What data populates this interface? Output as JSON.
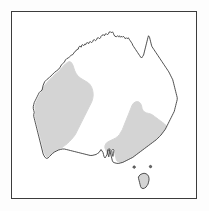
{
  "figure": {
    "kind": "distribution-map",
    "frame": {
      "border_color": "#3c3c3c",
      "border_width_px": 1.4,
      "background_color": "#ffffff",
      "outer_background_color": "#fdfdfd",
      "x": 11,
      "y": 11,
      "width": 186,
      "height": 188
    },
    "styles": {
      "coastline_color": "#3a3a3a",
      "coastline_width_px": 0.9,
      "land_fill_color": "#ffffff",
      "range_fill_color": "#d4d4d4",
      "range_edge_color": "#d4d4d4"
    },
    "landmasses": [
      {
        "name": "australia-mainland",
        "label": "Australia mainland"
      },
      {
        "name": "tasmania",
        "label": "Tasmania"
      },
      {
        "name": "bass-strait-islet-west",
        "label": "Bass Strait islet (west)"
      },
      {
        "name": "bass-strait-islet-east",
        "label": "Bass Strait islet (east)"
      }
    ],
    "shaded_regions": [
      {
        "name": "western-range",
        "label": "Western shaded distribution area",
        "fill": "#d4d4d4"
      },
      {
        "name": "eastern-range",
        "label": "Eastern shaded distribution area",
        "fill": "#d4d4d4"
      },
      {
        "name": "tasmania-range",
        "label": "Tasmania shaded distribution area",
        "fill": "#d4d4d4"
      }
    ]
  },
  "geometry": {
    "mainland_outline": "M 30.5,78.5 L 31.5,74.0 L 33.0,70.5 L 35.5,68.0 L 38.0,66.0 L 40.5,63.5 L 43.0,61.0 L 45.0,59.5 L 47.0,58.0 L 48.5,56.0 L 50.0,53.5 L 51.5,52.0 L 53.0,50.5 L 54.0,48.5 L 55.5,47.0 L 57.0,46.5 L 58.5,45.0 L 60.0,43.5 L 61.5,43.0 L 62.5,41.5 L 63.5,40.0 L 64.5,39.5 L 65.5,38.0 L 67.0,37.5 L 67.5,35.5 L 68.5,34.5 L 70.0,35.5 L 70.5,33.5 L 71.5,33.0 L 72.5,34.0 L 73.5,32.5 L 74.5,33.0 L 75.0,31.5 L 76.5,31.0 L 77.5,32.0 L 78.0,30.5 L 79.5,30.0 L 80.5,31.0 L 81.5,30.0 L 82.0,28.5 L 83.5,28.0 L 84.5,29.0 L 85.5,28.0 L 86.0,26.5 L 87.5,26.0 L 88.5,27.0 L 89.5,26.0 L 90.0,24.5 L 91.0,23.5 L 92.5,23.0 L 93.5,24.0 L 94.0,22.5 L 95.5,22.0 L 96.5,23.0 L 97.5,22.0 L 98.0,20.5 L 99.5,20.0 L 100.5,21.0 L 101.5,20.0 L 102.5,21.5 L 103.0,23.0 L 104.0,24.5 L 105.5,25.0 L 106.5,24.0 L 107.5,25.0 L 108.5,24.0 L 109.5,25.5 L 110.5,24.5 L 111.5,25.5 L 112.5,24.5 L 113.5,25.5 L 114.5,27.0 L 115.5,26.0 L 116.5,27.0 L 117.5,26.0 L 118.5,27.5 L 119.5,29.0 L 120.5,30.5 L 121.5,32.0 L 122.0,33.5 L 123.0,35.0 L 124.0,36.5 L 125.0,38.0 L 126.0,39.5 L 127.0,41.0 L 128.0,42.5 L 129.0,44.0 L 130.0,45.5 L 131.0,46.5 L 132.0,45.0 L 133.0,43.5 L 133.5,41.5 L 134.0,39.5 L 134.5,37.5 L 135.0,35.5 L 135.5,33.5 L 136.0,31.5 L 136.5,29.5 L 137.0,27.5 L 137.5,25.5 L 138.0,24.0 L 139.0,25.5 L 139.5,27.5 L 140.0,29.5 L 140.5,31.5 L 141.0,33.5 L 141.5,35.0 L 142.5,36.5 L 143.5,38.0 L 144.5,39.5 L 145.5,41.0 L 146.5,42.5 L 147.5,44.0 L 148.5,45.5 L 149.5,47.0 L 150.5,48.5 L 151.5,50.0 L 152.5,51.5 L 153.5,53.0 L 154.5,54.5 L 155.5,56.0 L 156.5,57.5 L 157.5,59.0 L 158.5,60.5 L 159.5,62.5 L 160.5,64.5 L 161.5,66.5 L 162.5,68.5 L 163.0,70.5 L 163.5,72.5 L 164.0,74.5 L 164.5,76.5 L 165.0,78.5 L 165.5,80.5 L 166.0,82.5 L 166.5,84.5 L 167.0,86.5 L 167.0,88.5 L 166.5,90.5 L 166.0,92.5 L 165.5,94.5 L 165.0,96.5 L 164.5,98.5 L 164.0,100.5 L 163.0,102.5 L 162.0,104.5 L 161.0,106.5 L 160.0,108.5 L 159.0,110.5 L 158.0,112.5 L 157.0,114.5 L 156.0,116.5 L 155.0,118.5 L 153.5,120.5 L 152.0,122.5 L 150.5,124.5 L 149.0,126.0 L 147.5,127.5 L 146.0,129.0 L 144.0,130.5 L 142.0,132.0 L 140.0,133.5 L 138.0,135.0 L 136.0,136.5 L 134.0,138.0 L 132.0,139.5 L 130.0,141.0 L 128.0,142.5 L 126.0,144.0 L 124.0,145.5 L 122.0,147.0 L 120.0,148.0 L 118.0,149.0 L 116.0,150.0 L 114.0,151.0 L 112.0,152.0 L 110.0,152.5 L 108.0,153.0 L 106.0,153.0 L 104.0,152.5 L 102.5,152.0 L 101.5,150.5 L 101.0,148.5 L 100.5,146.5 L 100.0,144.5 L 99.5,142.5 L 99.0,140.5 L 98.0,139.0 L 97.0,140.5 L 96.5,142.5 L 96.0,144.5 L 95.0,146.0 L 94.0,147.5 L 93.0,146.0 L 92.5,144.0 L 92.0,142.0 L 91.0,140.5 L 90.0,139.0 L 89.0,140.5 L 88.0,142.0 L 86.5,143.0 L 85.0,144.0 L 83.0,144.5 L 81.0,145.0 L 79.0,145.0 L 77.0,144.5 L 75.0,144.0 L 73.0,143.5 L 71.0,143.0 L 69.0,142.5 L 67.0,142.0 L 65.0,141.5 L 63.0,141.0 L 61.0,140.5 L 59.0,140.0 L 57.0,139.5 L 55.0,139.0 L 53.0,138.5 L 51.0,138.5 L 49.0,139.0 L 47.0,139.5 L 45.0,140.5 L 43.0,141.5 L 41.0,143.0 L 39.5,144.5 L 38.0,146.0 L 36.5,147.5 L 35.0,148.0 L 33.5,147.0 L 32.5,145.5 L 31.5,143.5 L 31.0,141.5 L 30.5,139.5 L 30.0,137.5 L 29.5,135.5 L 29.0,133.5 L 28.5,131.5 L 28.0,129.5 L 27.5,127.5 L 27.0,125.5 L 26.5,123.5 L 26.0,121.5 L 25.5,119.5 L 25.0,117.5 L 24.5,115.5 L 24.0,113.5 L 23.5,111.5 L 23.0,109.5 L 22.5,107.5 L 22.0,105.5 L 22.0,103.5 L 22.5,101.5 L 22.0,99.5 L 21.5,97.5 L 21.5,95.5 L 22.0,93.5 L 22.5,91.5 L 23.5,89.5 L 24.5,87.5 L 25.5,85.5 L 26.5,83.5 L 27.5,81.5 L 29.0,80.0 Z",
    "western_range": "M 33.5,73.5 L 36.0,70.5 L 38.5,68.0 L 41.0,65.5 L 43.5,63.0 L 46.0,61.0 L 48.0,59.0 L 50.0,56.5 L 52.0,54.5 L 54.0,52.5 L 56.0,51.0 L 58.0,50.0 L 60.0,51.0 L 61.5,53.5 L 62.5,56.5 L 63.5,59.5 L 65.0,62.5 L 67.0,65.0 L 69.5,67.0 L 72.0,68.5 L 74.5,70.0 L 77.0,71.5 L 79.0,73.5 L 80.5,76.0 L 81.5,79.0 L 82.0,82.0 L 82.0,85.0 L 81.5,88.0 L 80.5,91.0 L 79.0,94.0 L 77.5,97.0 L 76.0,100.0 L 74.5,103.0 L 73.0,106.0 L 71.5,109.0 L 70.0,112.0 L 68.5,115.0 L 67.0,118.0 L 65.5,121.0 L 64.0,124.0 L 62.0,126.5 L 60.0,129.0 L 58.0,131.0 L 56.0,133.0 L 54.0,134.5 L 52.0,136.0 L 50.0,137.5 L 48.0,138.5 L 46.0,139.5 L 44.0,140.5 L 42.0,142.0 L 40.0,143.5 L 38.0,145.0 L 36.5,146.0 L 35.2,146.5 L 34.0,145.0 L 33.0,143.0 L 32.3,141.0 L 31.8,139.0 L 31.3,137.0 L 30.8,135.0 L 30.3,133.0 L 29.8,131.0 L 29.3,129.0 L 28.8,127.0 L 28.3,125.0 L 27.8,123.0 L 27.3,121.0 L 26.8,119.0 L 26.3,117.0 L 25.8,115.0 L 25.3,113.0 L 24.8,111.0 L 24.3,109.0 L 23.8,107.0 L 23.5,105.0 L 23.5,103.0 L 24.0,101.0 L 23.5,99.0 L 23.2,97.0 L 23.2,95.0 L 23.8,93.0 L 24.5,91.0 L 25.5,89.0 L 26.5,87.0 L 27.5,85.0 L 28.5,83.0 L 29.5,81.0 L 31.0,78.5 L 32.0,76.0 Z",
    "eastern_range": "M 121.0,95.0 L 122.5,92.5 L 124.5,91.0 L 126.5,90.5 L 128.5,91.0 L 130.0,92.5 L 131.0,95.0 L 131.5,97.5 L 132.5,99.5 L 134.0,101.0 L 136.0,102.0 L 138.0,102.5 L 140.0,103.0 L 142.0,104.0 L 144.0,105.5 L 146.0,107.0 L 148.0,108.5 L 150.0,110.0 L 152.0,111.5 L 154.0,113.0 L 155.5,114.5 L 156.5,116.5 L 157.0,118.5 L 156.5,120.5 L 155.5,122.5 L 154.0,124.5 L 152.5,126.5 L 151.0,128.5 L 149.5,130.5 L 148.0,132.0 L 146.0,133.5 L 144.0,135.0 L 142.0,136.5 L 140.0,138.0 L 138.0,139.5 L 136.0,141.0 L 134.0,142.5 L 132.0,144.0 L 130.0,145.5 L 128.0,147.0 L 126.0,148.0 L 124.0,149.0 L 122.0,150.0 L 120.0,151.0 L 118.0,151.5 L 116.0,152.0 L 114.0,152.3 L 112.0,152.3 L 110.0,152.0 L 108.0,151.5 L 106.5,151.0 L 105.5,149.5 L 105.0,147.5 L 104.5,145.5 L 104.0,143.5 L 103.5,141.5 L 103.0,139.5 L 102.3,138.0 L 101.5,139.5 L 101.0,141.5 L 100.5,143.5 L 99.8,145.5 L 99.0,147.0 L 98.0,148.0 L 97.0,146.5 L 96.5,144.5 L 96.0,142.5 L 95.3,140.5 L 94.5,139.0 L 93.8,137.0 L 94.0,135.0 L 95.0,133.0 L 96.5,131.5 L 98.5,130.5 L 100.5,129.5 L 102.5,128.5 L 104.5,127.5 L 106.5,126.0 L 108.5,124.0 L 110.0,121.5 L 111.5,119.0 L 112.5,116.5 L 113.5,114.0 L 114.5,111.5 L 115.5,109.0 L 116.5,106.5 L 117.5,104.0 L 118.5,101.5 L 119.5,99.0 L 120.3,97.0 Z",
    "tasmania_outline": "M 128.0,166.5 L 129.5,164.5 L 131.5,163.5 L 133.5,163.0 L 135.5,163.5 L 137.0,164.5 L 138.0,166.0 L 138.5,168.0 L 138.5,170.0 L 138.0,172.0 L 137.5,174.0 L 136.5,175.5 L 135.5,177.0 L 134.0,178.0 L 132.5,178.5 L 131.0,178.0 L 130.0,176.5 L 129.5,174.5 L 129.0,172.5 L 128.5,170.5 L 128.0,168.5 Z",
    "islet_west": "M 122.5,156.0 L 123.5,155.5 L 124.5,156.0 L 124.8,157.2 L 124.0,158.0 L 122.8,157.8 L 122.2,157.0 Z",
    "islet_east": "M 139.0,155.5 L 140.0,155.0 L 141.0,155.5 L 141.3,156.7 L 140.5,157.5 L 139.3,157.3 L 138.8,156.5 Z",
    "spencer_gulf_notch": "M 96.5,139.5 L 97.2,143.5 L 97.8,146.5 L 98.4,144.0 L 98.8,140.5 L 99.2,138.8 L 97.8,138.2 Z",
    "st_vincent_notch": "M 100.8,140.0 L 101.4,143.5 L 102.0,146.0 L 102.6,143.0 L 103.0,139.8 L 102.2,138.6 Z"
  }
}
